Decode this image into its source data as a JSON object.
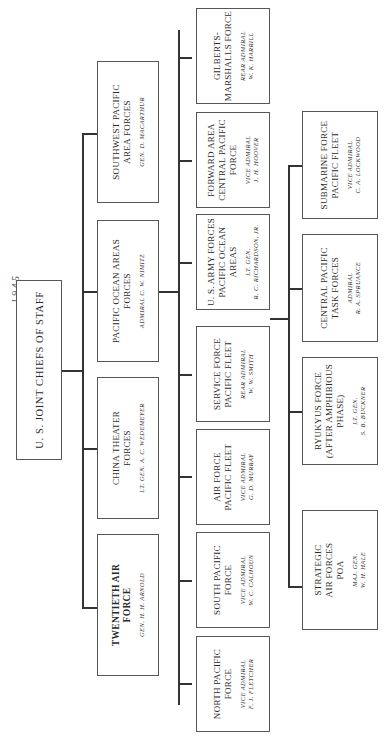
{
  "page": {
    "header_fragment": "… 1 9 4 5",
    "orientation": "rotated 90° counter-clockwise"
  },
  "root": {
    "title": "U. S. JOINT CHIEFS OF STAFF"
  },
  "tier1": [
    {
      "title": "SOUTHWEST PACIFIC AREA FORCES",
      "line1": "SOUTHWEST PACIFIC",
      "line2": "AREA FORCES",
      "commander": "GEN. D. MACARTHUR"
    },
    {
      "title": "PACIFIC OCEAN AREAS FORCES",
      "line1": "PACIFIC OCEAN AREAS",
      "line2": "FORCES",
      "commander": "ADMIRAL C. W. NIMITZ"
    },
    {
      "title": "CHINA THEATER FORCES",
      "line1": "CHINA THEATER",
      "line2": "FORCES",
      "commander": "LT. GEN. A. C. WEDEMEYER"
    },
    {
      "title": "TWENTIETH AIR FORCE",
      "line1": "TWENTIETH AIR",
      "line2": "FORCE",
      "commander": "GEN. H. H. ARNOLD"
    }
  ],
  "tier2": [
    {
      "line1": "GILBERTS-",
      "line2": "MARSHALLS FORCE",
      "line3": "",
      "cmd1": "REAR ADMIRAL",
      "cmd2": "W. K. HARRILL"
    },
    {
      "line1": "FORWARD AREA",
      "line2": "CENTRAL PACIFIC",
      "line3": "FORCE",
      "cmd1": "VICE ADMIRAL",
      "cmd2": "J. H. HOOVER"
    },
    {
      "line1": "U. S. ARMY FORCES",
      "line2": "PACIFIC OCEAN",
      "line3": "AREAS",
      "cmd1": "LT. GEN.",
      "cmd2": "R. C. RICHARDSON, JR."
    },
    {
      "line1": "SERVICE FORCE",
      "line2": "PACIFIC FLEET",
      "line3": "",
      "cmd1": "REAR ADMIRAL",
      "cmd2": "W. W. SMITH"
    },
    {
      "line1": "AIR FORCE",
      "line2": "PACIFIC FLEET",
      "line3": "",
      "cmd1": "VICE ADMIRAL",
      "cmd2": "G. D. MURRAY"
    },
    {
      "line1": "SOUTH PACIFIC",
      "line2": "FORCE",
      "line3": "",
      "cmd1": "VICE ADMIRAL",
      "cmd2": "W. C. CALHOUN"
    },
    {
      "line1": "NORTH PACIFIC",
      "line2": "FORCE",
      "line3": "",
      "cmd1": "VICE ADMIRAL",
      "cmd2": "F. J. FLETCHER"
    }
  ],
  "tier3": [
    {
      "line1": "SUBMARINE FORCE",
      "line2": "PACIFIC FLEET",
      "line3": "",
      "cmd1": "VICE ADMIRAL",
      "cmd2": "C. A. LOCKWOOD"
    },
    {
      "line1": "CENTRAL PACIFIC",
      "line2": "TASK FORCES",
      "line3": "",
      "cmd1": "ADMIRAL",
      "cmd2": "R. A. SPRUANCE"
    },
    {
      "line1": "RYUKYUS FORCE",
      "line2": "(AFTER AMPHIBIOUS",
      "line3": "PHASE)",
      "cmd1": "LT. GEN.",
      "cmd2": "S. B. BUCKNER"
    },
    {
      "line1": "STRATEGIC",
      "line2": "AIR FORCES",
      "line3": "POA",
      "cmd1": "MAJ. GEN.",
      "cmd2": "W. H. HALE"
    }
  ]
}
